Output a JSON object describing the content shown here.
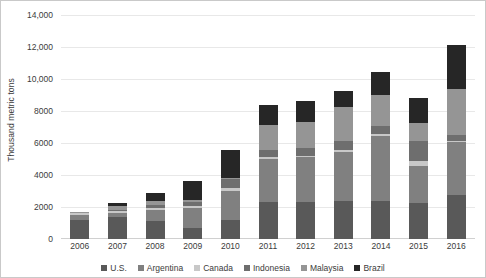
{
  "chart_data": {
    "type": "bar",
    "stacked": true,
    "title": "",
    "xlabel": "",
    "ylabel": "Thousand metric tons",
    "ylim": [
      0,
      14000
    ],
    "ytick_labels": [
      "0",
      "2000",
      "4000",
      "6000",
      "8000",
      "10,000",
      "12,000",
      "14,000"
    ],
    "ytick_values": [
      0,
      2000,
      4000,
      6000,
      8000,
      10000,
      12000,
      14000
    ],
    "grid": true,
    "legend_position": "bottom",
    "categories": [
      "2006",
      "2007",
      "2008",
      "2009",
      "2010",
      "2011",
      "2012",
      "2013",
      "2014",
      "2015",
      "2016"
    ],
    "series": [
      {
        "name": "U.S.",
        "color": "#595959",
        "values": [
          1200,
          1350,
          1100,
          700,
          1200,
          2300,
          2300,
          2350,
          2400,
          2250,
          2750
        ]
      },
      {
        "name": "Argentina",
        "color": "#808080",
        "values": [
          300,
          300,
          700,
          1250,
          1800,
          2700,
          2800,
          3100,
          4050,
          2300,
          3300
        ]
      },
      {
        "name": "Canada",
        "color": "#c8c8c8",
        "values": [
          120,
          120,
          170,
          120,
          200,
          100,
          100,
          100,
          120,
          300,
          100
        ]
      },
      {
        "name": "Indonesia",
        "color": "#6e6e6e",
        "values": [
          30,
          60,
          130,
          250,
          550,
          450,
          500,
          600,
          500,
          1300,
          350
        ]
      },
      {
        "name": "Malaysia",
        "color": "#959595",
        "values": [
          50,
          250,
          250,
          150,
          90,
          1550,
          1600,
          2100,
          1950,
          1100,
          2900
        ]
      },
      {
        "name": "Brazil",
        "color": "#262626",
        "values": [
          0,
          200,
          500,
          1150,
          1750,
          1300,
          1350,
          1000,
          1450,
          1550,
          2700
        ]
      }
    ],
    "totals": [
      1700,
      2280,
      2850,
      3620,
      5590,
      8400,
      8650,
      9250,
      10470,
      8800,
      12100
    ]
  },
  "legend": {
    "items": [
      {
        "label": "U.S.",
        "swatch": "legend-swatch-us"
      },
      {
        "label": "Argentina",
        "swatch": "legend-swatch-argentina"
      },
      {
        "label": "Canada",
        "swatch": "legend-swatch-canada"
      },
      {
        "label": "Indonesia",
        "swatch": "legend-swatch-indonesia"
      },
      {
        "label": "Malaysia",
        "swatch": "legend-swatch-malaysia"
      },
      {
        "label": "Brazil",
        "swatch": "legend-swatch-brazil"
      }
    ]
  }
}
